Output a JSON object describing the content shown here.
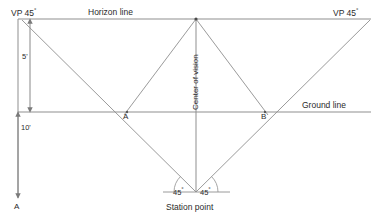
{
  "diagram": {
    "colors": {
      "line": "#8a8a8a",
      "line_dark": "#6e6e6e",
      "text": "#2b2b2b",
      "background": "#ffffff"
    },
    "labels": {
      "vp_left": "VP 45",
      "vp_left_degree": "°",
      "vp_right": "VP 45",
      "vp_right_degree": "°",
      "horizon_line": "Horizon line",
      "ground_line": "Ground line",
      "center_of_vision": "Center of vision",
      "station_point": "Station point",
      "dim_five": "5'",
      "dim_ten": "10'",
      "point_a_ground": "A",
      "point_b_ground": "B",
      "point_a_bottom": "A",
      "angle_left": "45",
      "angle_left_degree": "°",
      "angle_right": "45",
      "angle_right_degree": "°"
    },
    "geometry": {
      "horizon_line": {
        "x1": 18,
        "y1": 19,
        "x2": 371,
        "y2": 19
      },
      "ground_line": {
        "x1": 18,
        "y1": 112,
        "x2": 371,
        "y2": 112
      },
      "vertical_picture_plane": {
        "x": 18,
        "y1": 19,
        "y2": 205
      },
      "dimension_line_5ft": {
        "x": 30,
        "y1": 19,
        "y2": 112
      },
      "dimension_line_10ft": {
        "x": 18,
        "y1": 112,
        "y2": 198
      },
      "center_of_vision_vertical": {
        "x": 196,
        "y1": 19,
        "y2": 192
      },
      "vp_left_point": {
        "x": 22,
        "y": 21
      },
      "vp_right_point": {
        "x": 370,
        "y": 21
      },
      "center_of_vision_point": {
        "x": 196,
        "y": 19
      },
      "station_point": {
        "x": 196,
        "y": 192
      },
      "point_a_on_ground": {
        "x": 127,
        "y": 112
      },
      "point_b_on_ground": {
        "x": 265,
        "y": 112
      },
      "sightline_left": {
        "x1": 22,
        "y1": 21,
        "x2": 196,
        "y2": 192
      },
      "sightline_right": {
        "x1": 370,
        "y1": 21,
        "x2": 196,
        "y2": 192
      },
      "vp_left_to_cv_region": {
        "x1": 22,
        "y1": 21,
        "x2": 196,
        "y2": 19
      },
      "cv_to_a": {
        "x1": 196,
        "y1": 19,
        "x2": 127,
        "y2": 112
      },
      "cv_to_b": {
        "x1": 196,
        "y1": 19,
        "x2": 265,
        "y2": 112
      },
      "station_baseline": {
        "x1": 163,
        "y1": 192,
        "x2": 230,
        "y2": 192
      },
      "angle_left_value_deg": 45,
      "angle_right_value_deg": 45
    },
    "annotations": {
      "dim_five_value": "5'",
      "dim_ten_value": "10'",
      "vp_angle_value": "45°",
      "station_angles": [
        "45°",
        "45°"
      ]
    }
  }
}
